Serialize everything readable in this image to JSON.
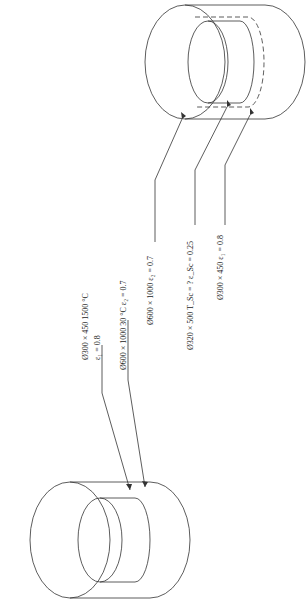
{
  "diagram": {
    "left_assembly": {
      "label_line1": "Ø300 × 450  1500 °C",
      "label_line2": "ε₁ = 0.8",
      "label_outer": "Ø600 × 1000  30 °C  ε₂ = 0.7"
    },
    "right_assembly": {
      "label_outer": "Ø600 × 1000   ε₂  =  0.7",
      "label_shield": "Ø320 × 500  T_Sc = ?   ε_Sc  =  0.25",
      "label_inner": "Ø300 × 450   ε₁  =  0.8"
    }
  }
}
